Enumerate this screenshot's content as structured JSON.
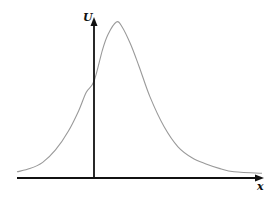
{
  "chart_data": {
    "type": "line",
    "title": "",
    "xlabel": "x",
    "ylabel": "U",
    "grid": false,
    "legend": null,
    "axis_style": "arrows, no ticks",
    "series": [
      {
        "name": "U(x)",
        "color": "#9a9a9a",
        "x": [
          -3.0,
          -2.5,
          -2.0,
          -1.5,
          -1.0,
          -0.6,
          -0.3,
          0.0,
          0.3,
          0.5,
          0.8,
          1.0,
          1.3,
          1.6,
          2.0,
          2.5,
          3.0,
          3.5,
          4.0,
          4.5,
          5.0,
          6.0
        ],
        "y": [
          0.04,
          0.06,
          0.1,
          0.18,
          0.3,
          0.43,
          0.55,
          0.62,
          0.82,
          0.92,
          1.0,
          0.97,
          0.86,
          0.72,
          0.52,
          0.33,
          0.2,
          0.13,
          0.09,
          0.06,
          0.04,
          0.03
        ]
      }
    ],
    "xlim": [
      -3.0,
      6.0
    ],
    "ylim": [
      0,
      1.0
    ],
    "peak": {
      "x": 0.8,
      "y": 1.0
    }
  },
  "labels": {
    "y_axis": "U",
    "x_axis": "x"
  },
  "colors": {
    "axis": "#111111",
    "curve": "#9a9a9a",
    "background": "#ffffff"
  }
}
